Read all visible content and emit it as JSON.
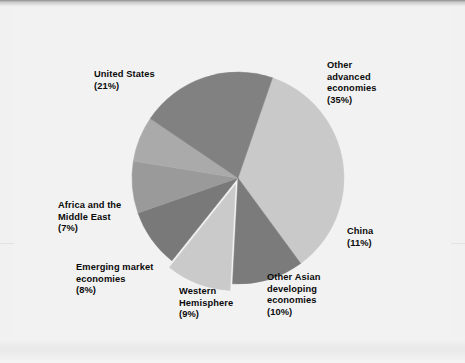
{
  "figure": {
    "background_color": "#f1f1f1",
    "plot_background_color": "#f2f2f2",
    "title": ""
  },
  "chart_data": {
    "type": "pie",
    "title": "",
    "subtitle": "",
    "xlabel": "",
    "ylabel": "",
    "legend_position": "none",
    "grid": false,
    "units": "percent",
    "total": 101,
    "categories": [
      "Other advanced economies",
      "China",
      "Other Asian developing economies",
      "Western Hemisphere",
      "Emerging market economies",
      "Africa and the Middle East",
      "United States"
    ],
    "values": [
      35,
      11,
      10,
      9,
      8,
      7,
      21
    ],
    "slices": [
      {
        "name": "other-advanced-economies",
        "label_line1": "Other",
        "label_line2": "advanced",
        "label_line3": "economies",
        "value": 35,
        "value_text": "(35%)",
        "color": "#c9c9c9",
        "exploded": false
      },
      {
        "name": "china",
        "label_line1": "China",
        "label_line2": "",
        "label_line3": "",
        "value": 11,
        "value_text": "(11%)",
        "color": "#7b7b7b",
        "exploded": false
      },
      {
        "name": "other-asian-developing-economies",
        "label_line1": "Other Asian",
        "label_line2": "developing",
        "label_line3": "economies",
        "value": 10,
        "value_text": "(10%)",
        "color": "#cacaca",
        "exploded": true
      },
      {
        "name": "western-hemisphere",
        "label_line1": "Western",
        "label_line2": "Hemisphere",
        "label_line3": "",
        "value": 9,
        "value_text": "(9%)",
        "color": "#797979",
        "exploded": false
      },
      {
        "name": "emerging-market-economies",
        "label_line1": "Emerging market",
        "label_line2": "economies",
        "label_line3": "",
        "value": 8,
        "value_text": "(8%)",
        "color": "#9a9a9a",
        "exploded": false
      },
      {
        "name": "africa-and-the-middle-east",
        "label_line1": "Africa and the",
        "label_line2": "Middle East",
        "label_line3": "",
        "value": 7,
        "value_text": "(7%)",
        "color": "#aaaaaa",
        "exploded": false
      },
      {
        "name": "united-states",
        "label_line1": "United States",
        "label_line2": "",
        "label_line3": "",
        "value": 21,
        "value_text": "(21%)",
        "color": "#818181",
        "exploded": false
      }
    ]
  }
}
